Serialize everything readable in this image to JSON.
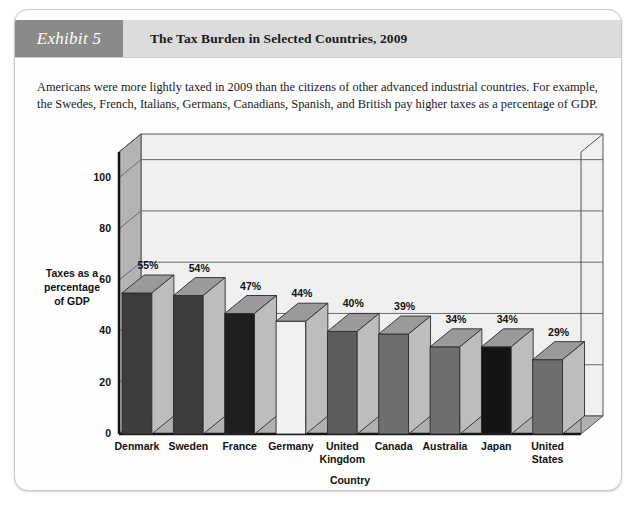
{
  "exhibit": {
    "tab_label": "Exhibit 5",
    "title": "The Tax Burden in Selected Countries, 2009"
  },
  "description": "Americans were more lightly taxed in 2009 than the citizens of other advanced industrial countries. For example, the Swedes, French, Italians, Germans, Canadians, Spanish, and British pay higher taxes as a percentage of GDP.",
  "chart_data": {
    "type": "bar",
    "title": "The Tax Burden in Selected Countries, 2009",
    "xlabel": "Country",
    "ylabel": "Taxes as a percentage of GDP",
    "ylim": [
      0,
      110
    ],
    "yticks": [
      0,
      20,
      40,
      60,
      80,
      100
    ],
    "ytick_labels": [
      "0",
      "20",
      "40",
      "60",
      "80",
      "100"
    ],
    "grid": true,
    "legend": "none",
    "three_d": true,
    "categories": [
      "Denmark",
      "Sweden",
      "France",
      "Germany",
      "United Kingdom",
      "Canada",
      "Australia",
      "Japan",
      "United States"
    ],
    "category_lines": [
      [
        "Denmark"
      ],
      [
        "Sweden"
      ],
      [
        "France"
      ],
      [
        "Germany"
      ],
      [
        "United",
        "Kingdom"
      ],
      [
        "Canada"
      ],
      [
        "Australia"
      ],
      [
        "Japan"
      ],
      [
        "United",
        "States"
      ]
    ],
    "values": [
      55,
      54,
      47,
      44,
      40,
      39,
      34,
      34,
      29
    ],
    "value_labels": [
      "55%",
      "54%",
      "47%",
      "44%",
      "40%",
      "39%",
      "34%",
      "34%",
      "29%"
    ],
    "bar_colors": [
      "#3c3c3c",
      "#3c3c3c",
      "#1e1e1e",
      "#f2f2f2",
      "#5c5c5c",
      "#6f6f6f",
      "#6f6f6f",
      "#141414",
      "#6f6f6f"
    ]
  },
  "palette": {
    "tab_bg": "#8a8a8a",
    "title_bg": "#dcdcdc",
    "plot_back": "#f0f0f0",
    "plot_wall": "#b4b4b4",
    "floor": "#b0b0b0",
    "axis_line": "#141414",
    "grid_line": "#6a6a6a",
    "card_bg": "#fefefe"
  }
}
